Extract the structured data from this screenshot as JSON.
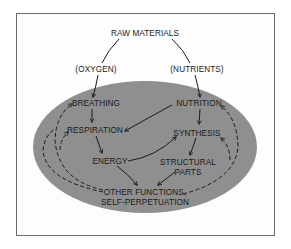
{
  "diagram": {
    "type": "flow",
    "colors": {
      "oval": "#8f8f8f",
      "frame": "#6a6a6a",
      "ink": "#1a1a1a",
      "background": "#ffffff"
    },
    "nodes": {
      "raw_materials": "RAW MATERIALS",
      "oxygen": "(OXYGEN)",
      "nutrients": "(NUTRIENTS)",
      "breathing": "BREATHING",
      "nutrition": "NUTRITION",
      "respiration": "RESPIRATION",
      "synthesis": "SYNTHESIS",
      "energy": "ENERGY",
      "structural_1": "STRUCTURAL",
      "structural_2": "PARTS",
      "other_1": "OTHER FUNCTIONS,",
      "other_2": "SELF-PERPETUATION"
    },
    "edges": [
      {
        "from": "RAW MATERIALS",
        "to": "(OXYGEN)",
        "style": "solid"
      },
      {
        "from": "RAW MATERIALS",
        "to": "(NUTRIENTS)",
        "style": "solid"
      },
      {
        "from": "(OXYGEN)",
        "to": "BREATHING",
        "style": "solid"
      },
      {
        "from": "(NUTRIENTS)",
        "to": "NUTRITION",
        "style": "solid"
      },
      {
        "from": "BREATHING",
        "to": "RESPIRATION",
        "style": "solid"
      },
      {
        "from": "NUTRITION",
        "to": "RESPIRATION",
        "style": "solid"
      },
      {
        "from": "NUTRITION",
        "to": "SYNTHESIS",
        "style": "solid"
      },
      {
        "from": "RESPIRATION",
        "to": "ENERGY",
        "style": "solid"
      },
      {
        "from": "ENERGY",
        "to": "SYNTHESIS",
        "style": "solid"
      },
      {
        "from": "SYNTHESIS",
        "to": "STRUCTURAL PARTS",
        "style": "solid"
      },
      {
        "from": "ENERGY",
        "to": "OTHER FUNCTIONS, SELF-PERPETUATION",
        "style": "solid"
      },
      {
        "from": "STRUCTURAL PARTS",
        "to": "OTHER FUNCTIONS, SELF-PERPETUATION",
        "style": "solid"
      },
      {
        "from": "OTHER FUNCTIONS, SELF-PERPETUATION",
        "to": "BREATHING",
        "style": "dashed"
      },
      {
        "from": "OTHER FUNCTIONS, SELF-PERPETUATION",
        "to": "RESPIRATION",
        "style": "dashed"
      },
      {
        "from": "OTHER FUNCTIONS, SELF-PERPETUATION",
        "to": "NUTRITION",
        "style": "dashed"
      },
      {
        "from": "OTHER FUNCTIONS, SELF-PERPETUATION",
        "to": "SYNTHESIS",
        "style": "dashed"
      }
    ]
  }
}
